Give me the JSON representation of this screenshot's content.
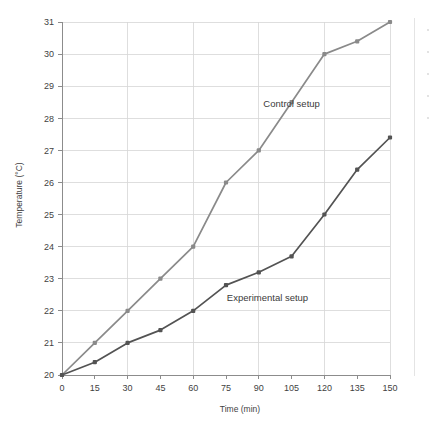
{
  "chart_data": {
    "type": "line",
    "title": "",
    "xlabel": "Time (min)",
    "ylabel": "Temperature (°C)",
    "x": [
      0,
      15,
      30,
      45,
      60,
      75,
      90,
      105,
      120,
      135,
      150
    ],
    "xlim": [
      0,
      150
    ],
    "ylim": [
      20,
      31
    ],
    "xticks": [
      "0",
      "15",
      "30",
      "45",
      "60",
      "75",
      "90",
      "105",
      "120",
      "135",
      "150"
    ],
    "yticks": [
      "20",
      "21",
      "22",
      "23",
      "24",
      "25",
      "26",
      "27",
      "28",
      "29",
      "30",
      "31"
    ],
    "grid": true,
    "legend_position": "inline-annotation",
    "series": [
      {
        "name": "Control setup",
        "color": "#8a8a8a",
        "marker": "square",
        "values": [
          20,
          21,
          22,
          23,
          24,
          26,
          27,
          28.5,
          30,
          30.4,
          31
        ],
        "label_x": 105,
        "label_y": 28.35
      },
      {
        "name": "Experimental setup",
        "color": "#535353",
        "marker": "square",
        "values": [
          20,
          20.4,
          21,
          21.4,
          22,
          22.8,
          23.2,
          23.7,
          25,
          26.4,
          27.4
        ],
        "label_x": 94,
        "label_y": 22.3
      }
    ],
    "annotations": [
      {
        "text": "Control setup",
        "x": 105,
        "y": 28.35
      },
      {
        "text": "Experimental setup",
        "x": 94,
        "y": 22.3
      }
    ]
  },
  "colors": {
    "background": "#ffffff",
    "grid": "#d6d6d6",
    "axis": "#8c8c8c",
    "text": "#3f3f3f",
    "control": "#8a8a8a",
    "experimental": "#535353"
  }
}
